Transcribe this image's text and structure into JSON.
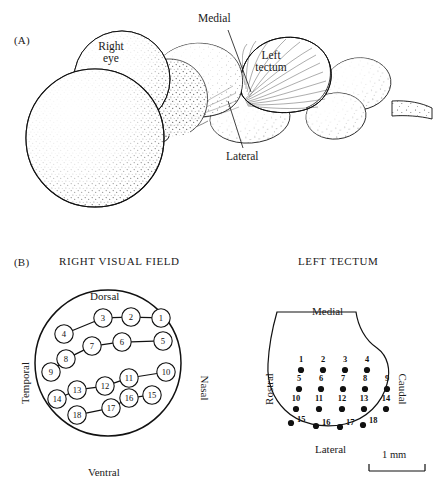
{
  "figure": {
    "panel_a": {
      "letter": "(A)",
      "labels": [
        {
          "name": "right-eye",
          "text": "Right\neye",
          "x": 104,
          "y": 44
        },
        {
          "name": "medial",
          "text": "Medial",
          "x": 206,
          "y": 20
        },
        {
          "name": "left-tectum",
          "text": "Left\ntectum",
          "x": 259,
          "y": 56
        },
        {
          "name": "lateral",
          "text": "Lateral",
          "x": 232,
          "y": 155
        }
      ]
    },
    "panel_b": {
      "letter": "(B)",
      "left_title": "RIGHT VISUAL FIELD",
      "right_title": "LEFT TECTUM",
      "visual_field": {
        "axes": {
          "top": "Dorsal",
          "bottom": "Ventral",
          "left": "Temporal",
          "right": "Nasal"
        },
        "nodes": [
          {
            "id": 1,
            "label": "1",
            "x": 161,
            "y": 318
          },
          {
            "id": 2,
            "label": "2",
            "x": 131,
            "y": 317
          },
          {
            "id": 3,
            "label": "3",
            "x": 103,
            "y": 318
          },
          {
            "id": 4,
            "label": "4",
            "x": 64,
            "y": 334
          },
          {
            "id": 5,
            "label": "5",
            "x": 163,
            "y": 341
          },
          {
            "id": 6,
            "label": "6",
            "x": 122,
            "y": 342
          },
          {
            "id": 7,
            "label": "7",
            "x": 92,
            "y": 346
          },
          {
            "id": 8,
            "label": "8",
            "x": 66,
            "y": 359
          },
          {
            "id": 9,
            "label": "9",
            "x": 51,
            "y": 372
          },
          {
            "id": 10,
            "label": "10",
            "x": 166,
            "y": 372
          },
          {
            "id": 11,
            "label": "11",
            "x": 129,
            "y": 378
          },
          {
            "id": 12,
            "label": "12",
            "x": 105,
            "y": 386
          },
          {
            "id": 13,
            "label": "13",
            "x": 77,
            "y": 390
          },
          {
            "id": 14,
            "label": "14",
            "x": 57,
            "y": 399
          },
          {
            "id": 15,
            "label": "15",
            "x": 152,
            "y": 395
          },
          {
            "id": 16,
            "label": "16",
            "x": 129,
            "y": 398
          },
          {
            "id": 17,
            "label": "17",
            "x": 111,
            "y": 408
          },
          {
            "id": 18,
            "label": "18",
            "x": 77,
            "y": 415
          }
        ],
        "chains": [
          [
            1,
            2,
            3,
            4
          ],
          [
            5,
            6,
            7,
            8,
            9
          ],
          [
            10,
            11,
            12,
            13,
            14
          ],
          [
            15,
            16,
            17,
            18
          ]
        ]
      },
      "tectum": {
        "axes": {
          "top": "Medial",
          "bottom": "Lateral",
          "left": "Rostral",
          "right": "Caudal"
        },
        "scale_bar": {
          "label": "1 mm"
        },
        "dots": [
          {
            "id": 1,
            "label": "1",
            "x": 301,
            "y": 370,
            "lx": 301,
            "ly": 362,
            "anchor": "middle"
          },
          {
            "id": 2,
            "label": "2",
            "x": 323,
            "y": 370,
            "lx": 323,
            "ly": 362,
            "anchor": "middle"
          },
          {
            "id": 3,
            "label": "3",
            "x": 345,
            "y": 370,
            "lx": 345,
            "ly": 362,
            "anchor": "middle"
          },
          {
            "id": 4,
            "label": "4",
            "x": 367,
            "y": 370,
            "lx": 367,
            "ly": 362,
            "anchor": "middle"
          },
          {
            "id": 5,
            "label": "5",
            "x": 299,
            "y": 389,
            "lx": 299,
            "ly": 381,
            "anchor": "middle"
          },
          {
            "id": 6,
            "label": "6",
            "x": 321,
            "y": 389,
            "lx": 321,
            "ly": 381,
            "anchor": "middle"
          },
          {
            "id": 7,
            "label": "7",
            "x": 343,
            "y": 389,
            "lx": 343,
            "ly": 381,
            "anchor": "middle"
          },
          {
            "id": 8,
            "label": "8",
            "x": 365,
            "y": 389,
            "lx": 365,
            "ly": 381,
            "anchor": "middle"
          },
          {
            "id": 9,
            "label": "9",
            "x": 387,
            "y": 389,
            "lx": 387,
            "ly": 381,
            "anchor": "middle"
          },
          {
            "id": 10,
            "label": "10",
            "x": 296,
            "y": 409,
            "lx": 296,
            "ly": 401,
            "anchor": "middle"
          },
          {
            "id": 11,
            "label": "11",
            "x": 319,
            "y": 409,
            "lx": 319,
            "ly": 401,
            "anchor": "middle"
          },
          {
            "id": 12,
            "label": "12",
            "x": 342,
            "y": 409,
            "lx": 342,
            "ly": 401,
            "anchor": "middle"
          },
          {
            "id": 13,
            "label": "13",
            "x": 364,
            "y": 409,
            "lx": 364,
            "ly": 401,
            "anchor": "middle"
          },
          {
            "id": 14,
            "label": "14",
            "x": 386,
            "y": 409,
            "lx": 386,
            "ly": 401,
            "anchor": "middle"
          },
          {
            "id": 15,
            "label": "15",
            "x": 291,
            "y": 423,
            "lx": 297,
            "ly": 422,
            "anchor": "start"
          },
          {
            "id": 16,
            "label": "16",
            "x": 316,
            "y": 426,
            "lx": 322,
            "ly": 425,
            "anchor": "start"
          },
          {
            "id": 17,
            "label": "17",
            "x": 340,
            "y": 427,
            "lx": 346,
            "ly": 425,
            "anchor": "start"
          },
          {
            "id": 18,
            "label": "18",
            "x": 363,
            "y": 425,
            "lx": 369,
            "ly": 423,
            "anchor": "start"
          }
        ]
      }
    }
  }
}
